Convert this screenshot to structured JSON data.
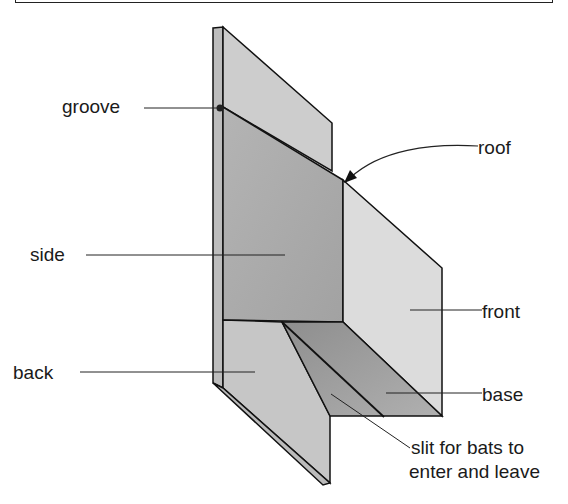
{
  "diagram": {
    "labels": {
      "groove": "groove",
      "roof": "roof",
      "side": "side",
      "front": "front",
      "back": "back",
      "base": "base",
      "slit_line1": "slit for bats to",
      "slit_line2": "enter and leave"
    },
    "colors": {
      "outline": "#111111",
      "back_panel": "#cfcfcf",
      "side_panel": "#aaaaaa",
      "front_panel": "#dedede",
      "base_panel": "#9a9a9a",
      "back_lower": "#c8c8c8"
    }
  }
}
